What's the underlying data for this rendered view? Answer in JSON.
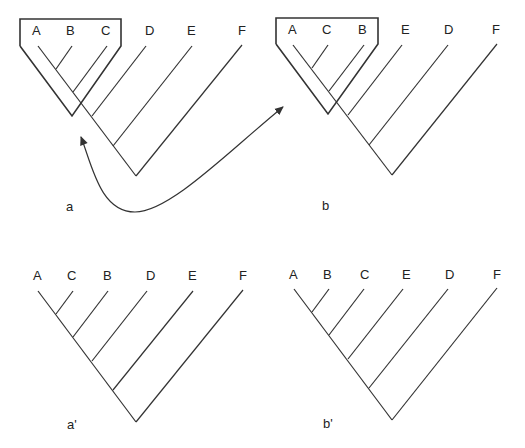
{
  "colors": {
    "line": "#333333",
    "text": "#222222",
    "background": "#ffffff"
  },
  "panels": [
    {
      "id": "a",
      "caption": "a",
      "leaves": [
        "A",
        "B",
        "C",
        "D",
        "E",
        "F"
      ],
      "highlighted_clade": [
        "A",
        "B",
        "C"
      ]
    },
    {
      "id": "b",
      "caption": "b",
      "leaves": [
        "A",
        "C",
        "B",
        "E",
        "D",
        "F"
      ],
      "highlighted_clade": [
        "A",
        "C",
        "B"
      ]
    },
    {
      "id": "a-prime",
      "caption": "a'",
      "leaves": [
        "A",
        "C",
        "B",
        "D",
        "E",
        "F"
      ]
    },
    {
      "id": "b-prime",
      "caption": "b'",
      "leaves": [
        "A",
        "B",
        "C",
        "E",
        "D",
        "F"
      ]
    }
  ],
  "arrow": {
    "description": "double-headed curved arrow linking boxed clade of tree a and tree b"
  }
}
